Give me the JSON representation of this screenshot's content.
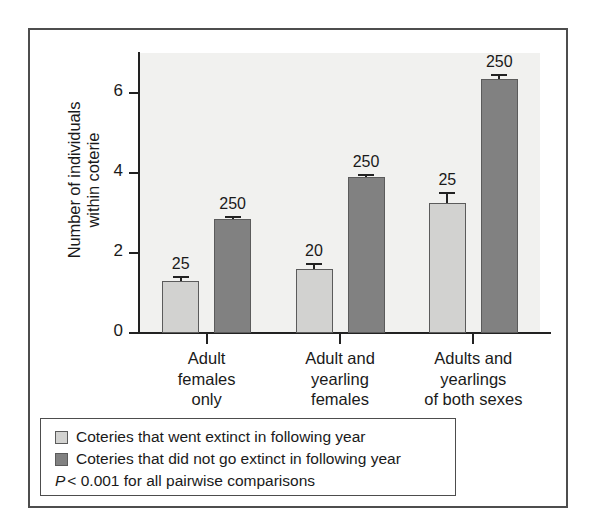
{
  "chart_data": {
    "type": "bar",
    "title": "",
    "xlabel": "",
    "ylabel": "Number of individuals within coterie",
    "ylabel_line1": "Number of individuals",
    "ylabel_line2": "within coterie",
    "ylim": [
      0,
      7
    ],
    "yticks": [
      0,
      2,
      4,
      6
    ],
    "ytick_labels": [
      "0",
      "2",
      "4",
      "6"
    ],
    "grid": false,
    "legend_position": "below-plot",
    "categories": [
      "Adult females only",
      "Adult and yearling females",
      "Adults and yearlings of both sexes"
    ],
    "category_label_lines": [
      [
        "Adult",
        "females",
        "only"
      ],
      [
        "Adult and",
        "yearling",
        "females"
      ],
      [
        "Adults and",
        "yearlings",
        "of both sexes"
      ]
    ],
    "series": [
      {
        "name": "Coteries that went extinct in following year",
        "color": "#d2d2d0",
        "values": [
          1.3,
          1.6,
          3.25
        ],
        "errors": [
          0.13,
          0.15,
          0.27
        ],
        "sample_sizes": [
          "25",
          "20",
          "25"
        ]
      },
      {
        "name": "Coteries that did not go extinct in following year",
        "color": "#818181",
        "values": [
          2.85,
          3.9,
          6.35
        ],
        "errors": [
          0.08,
          0.07,
          0.13
        ],
        "sample_sizes": [
          "250",
          "250",
          "250"
        ]
      }
    ],
    "annotation": "P < 0.001 for all pairwise comparisons",
    "annotation_italic_prefix": "P",
    "annotation_rest": " < 0.001 for all pairwise comparisons"
  },
  "legend": {
    "items": [
      {
        "label": "Coteries that went extinct in following year",
        "swatch": "light"
      },
      {
        "label": "Coteries that did not go extinct in following year",
        "swatch": "dark"
      }
    ]
  },
  "colors": {
    "bar_light": "#d2d2d0",
    "bar_dark": "#818181",
    "axis": "#222222",
    "plot_background": "#f1f1ef",
    "frame": "#4d4d4d"
  }
}
